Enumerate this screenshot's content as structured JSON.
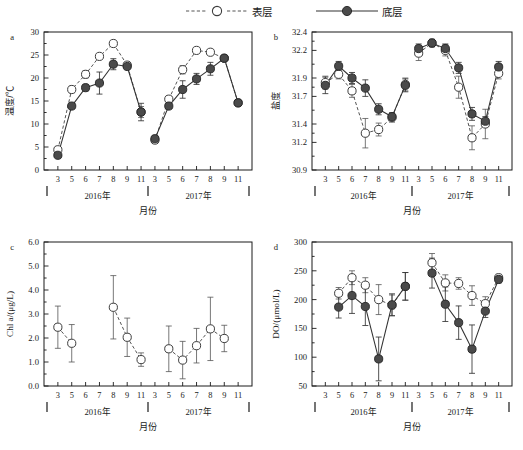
{
  "legend": {
    "items": [
      {
        "label": "表层",
        "style": "dashed-open-circle",
        "name": "legend-surface-layer"
      },
      {
        "label": "底层",
        "style": "solid-filled-circle",
        "name": "legend-bottom-layer"
      }
    ]
  },
  "axis_common": {
    "xlabel": "月份",
    "months": [
      3,
      5,
      6,
      7,
      8,
      9,
      11
    ],
    "years": [
      "2016年",
      "2017年"
    ]
  },
  "chart_data": [
    {
      "panel": "a",
      "type": "line",
      "title": "",
      "ylabel": "温度/℃",
      "xlabel": "月份",
      "ylim": [
        0,
        30
      ],
      "yticks": [
        0,
        5,
        10,
        15,
        20,
        25,
        30
      ],
      "ytick_labels": [
        "0",
        "5",
        "10",
        "15",
        "20",
        "25",
        "30"
      ],
      "grid": false,
      "legend_position": "top",
      "x": [
        "2016-3",
        "2016-5",
        "2016-6",
        "2016-7",
        "2016-8",
        "2016-9",
        "2016-11",
        "2017-3",
        "2017-5",
        "2017-6",
        "2017-7",
        "2017-8",
        "2017-9",
        "2017-11"
      ],
      "xtick_labels": [
        "3",
        "5",
        "6",
        "7",
        "8",
        "9",
        "11",
        "3",
        "5",
        "6",
        "7",
        "8",
        "9",
        "11"
      ],
      "series": [
        {
          "name": "表层",
          "marker": "open-circle",
          "line": "dashed",
          "values": [
            4.4,
            17.5,
            20.8,
            24.7,
            27.5,
            22.8,
            12.6,
            6.5,
            15.4,
            21.8,
            26.0,
            25.6,
            24.3,
            14.6
          ],
          "errors": [
            0.5,
            0.7,
            0.8,
            0.6,
            0.3,
            0.5,
            1.2,
            0.5,
            0.5,
            0.9,
            0.6,
            0.4,
            0.4,
            0.5
          ]
        },
        {
          "name": "底层",
          "marker": "filled-circle",
          "line": "solid",
          "values": [
            3.2,
            13.9,
            17.9,
            18.9,
            23.0,
            22.5,
            12.6,
            6.8,
            13.9,
            17.5,
            19.8,
            22.0,
            24.3,
            14.6
          ],
          "errors": [
            0.4,
            0.6,
            0.7,
            2.4,
            1.2,
            0.4,
            1.9,
            0.5,
            0.5,
            1.9,
            1.2,
            1.4,
            0.4,
            0.5
          ]
        }
      ]
    },
    {
      "panel": "b",
      "type": "line",
      "title": "",
      "ylabel": "盐度",
      "xlabel": "月份",
      "ylim": [
        30.9,
        32.4
      ],
      "yticks": [
        30.9,
        31.2,
        31.4,
        31.7,
        31.9,
        32.2,
        32.4
      ],
      "ytick_labels": [
        "30.9",
        "31.2",
        "31.4",
        "31.7",
        "31.9",
        "32.2",
        "32.4"
      ],
      "grid": false,
      "legend_position": "top",
      "x": [
        "2016-3",
        "2016-5",
        "2016-6",
        "2016-7",
        "2016-8",
        "2016-9",
        "2016-11",
        "2017-3",
        "2017-5",
        "2017-6",
        "2017-7",
        "2017-8",
        "2017-9",
        "2017-11"
      ],
      "xtick_labels": [
        "3",
        "5",
        "6",
        "7",
        "8",
        "9",
        "11",
        "3",
        "5",
        "6",
        "7",
        "8",
        "9",
        "11"
      ],
      "series": [
        {
          "name": "表层",
          "marker": "open-circle",
          "line": "dashed",
          "values": [
            31.85,
            31.94,
            31.76,
            31.3,
            31.34,
            31.47,
            31.83,
            32.17,
            32.28,
            32.2,
            31.8,
            31.25,
            31.4,
            31.95
          ],
          "errors": [
            0.07,
            0.05,
            0.07,
            0.16,
            0.07,
            0.05,
            0.07,
            0.08,
            0.04,
            0.06,
            0.12,
            0.13,
            0.16,
            0.06
          ]
        },
        {
          "name": "底层",
          "marker": "filled-circle",
          "line": "solid",
          "values": [
            31.82,
            32.03,
            31.9,
            31.79,
            31.56,
            31.48,
            31.82,
            32.22,
            32.28,
            32.22,
            32.01,
            31.51,
            31.43,
            32.02
          ],
          "errors": [
            0.09,
            0.05,
            0.06,
            0.09,
            0.06,
            0.04,
            0.07,
            0.05,
            0.04,
            0.05,
            0.06,
            0.07,
            0.05,
            0.06
          ]
        }
      ]
    },
    {
      "panel": "c",
      "type": "line",
      "title": "",
      "ylabel": "Chl a/(μg/L)",
      "xlabel": "月份",
      "ylim": [
        0.0,
        6.0
      ],
      "yticks": [
        0.0,
        1.0,
        2.0,
        3.0,
        4.0,
        5.0,
        6.0
      ],
      "ytick_labels": [
        "0.0",
        "1.0",
        "2.0",
        "3.0",
        "4.0",
        "5.0",
        "6.0"
      ],
      "grid": false,
      "legend_position": "top",
      "x": [
        "2016-3",
        "2016-5",
        "2016-6",
        "2016-7",
        "2016-8",
        "2016-9",
        "2016-11",
        "2017-3",
        "2017-5",
        "2017-6",
        "2017-7",
        "2017-8",
        "2017-9",
        "2017-11"
      ],
      "xtick_labels": [
        "3",
        "5",
        "6",
        "7",
        "8",
        "9",
        "11",
        "3",
        "5",
        "6",
        "7",
        "8",
        "9",
        "11"
      ],
      "series": [
        {
          "name": "表层",
          "marker": "open-circle",
          "line": "dashed",
          "values": [
            2.45,
            1.78,
            null,
            null,
            3.28,
            2.03,
            1.1,
            null,
            1.55,
            1.08,
            1.68,
            2.38,
            1.98,
            null
          ],
          "errors": [
            0.88,
            0.78,
            null,
            null,
            1.32,
            0.8,
            0.28,
            null,
            0.95,
            0.78,
            0.72,
            1.32,
            0.55,
            null
          ]
        }
      ]
    },
    {
      "panel": "d",
      "type": "line",
      "title": "",
      "ylabel": "DO/(μmol/L)",
      "xlabel": "月份",
      "ylim": [
        50,
        300
      ],
      "yticks": [
        50,
        100,
        150,
        200,
        250,
        300
      ],
      "ytick_labels": [
        "50",
        "100",
        "150",
        "200",
        "250",
        "300"
      ],
      "grid": false,
      "legend_position": "top",
      "x": [
        "2016-3",
        "2016-5",
        "2016-6",
        "2016-7",
        "2016-8",
        "2016-9",
        "2016-11",
        "2017-3",
        "2017-5",
        "2017-6",
        "2017-7",
        "2017-8",
        "2017-9",
        "2017-11"
      ],
      "xtick_labels": [
        "3",
        "5",
        "6",
        "7",
        "8",
        "9",
        "11",
        "3",
        "5",
        "6",
        "7",
        "8",
        "9",
        "11"
      ],
      "series": [
        {
          "name": "表层",
          "marker": "open-circle",
          "line": "dashed",
          "values": [
            null,
            211,
            238,
            225,
            200,
            190,
            223,
            null,
            264,
            229,
            228,
            207,
            193,
            238
          ],
          "errors": [
            null,
            10,
            12,
            13,
            26,
            18,
            24,
            null,
            16,
            14,
            10,
            17,
            12,
            6
          ]
        },
        {
          "name": "底层",
          "marker": "filled-circle",
          "line": "solid",
          "values": [
            null,
            187,
            207,
            188,
            97,
            191,
            223,
            null,
            246,
            192,
            160,
            114,
            180,
            235
          ],
          "errors": [
            null,
            19,
            31,
            33,
            38,
            19,
            24,
            null,
            26,
            30,
            29,
            42,
            11,
            6
          ]
        }
      ]
    }
  ]
}
